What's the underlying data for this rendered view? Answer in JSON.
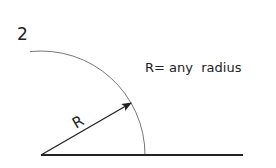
{
  "figure": {
    "number_label": "2",
    "radius_label": "R",
    "annotation": "R= any  radius"
  },
  "geometry": {
    "center": [
      41,
      155
    ],
    "radius": 104,
    "baseline_end_x": 243,
    "arrow_tip": [
      131,
      103
    ]
  },
  "colors": {
    "line": "#222222",
    "arc": "#777777",
    "background": "#ffffff"
  }
}
